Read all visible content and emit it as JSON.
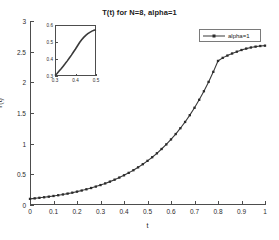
{
  "figure": {
    "background": "#ffffff",
    "line_color": "#3a3a3a",
    "marker_color": "#2b2b2b",
    "axis_color": "#4d4d4d"
  },
  "chart_data": {
    "type": "line",
    "title": "T(t) for N=8, alpha=1",
    "xlabel": "t",
    "ylabel": "T(t)",
    "xlim": [
      0,
      1
    ],
    "ylim": [
      0,
      3
    ],
    "grid": false,
    "legend_position": "upper right",
    "xticks": [
      "0",
      "0.1",
      "0.2",
      "0.3",
      "0.4",
      "0.5",
      "0.6",
      "0.7",
      "0.8",
      "0.9",
      "1"
    ],
    "xtick_values": [
      0,
      0.1,
      0.2,
      0.3,
      0.4,
      0.5,
      0.6,
      0.7,
      0.8,
      0.9,
      1
    ],
    "yticks": [
      "0",
      "0.5",
      "1",
      "1.5",
      "2",
      "2.5",
      "3"
    ],
    "ytick_values": [
      0,
      0.5,
      1,
      1.5,
      2,
      2.5,
      3
    ],
    "series": [
      {
        "name": "alpha=1",
        "marker": "square",
        "linestyle": "solid",
        "x": [
          0,
          0.02,
          0.04,
          0.06,
          0.08,
          0.1,
          0.12,
          0.14,
          0.16,
          0.18,
          0.2,
          0.22,
          0.24,
          0.26,
          0.28,
          0.3,
          0.32,
          0.34,
          0.36,
          0.38,
          0.4,
          0.42,
          0.44,
          0.46,
          0.48,
          0.5,
          0.52,
          0.54,
          0.56,
          0.58,
          0.6,
          0.62,
          0.64,
          0.66,
          0.68,
          0.7,
          0.72,
          0.74,
          0.76,
          0.78,
          0.8,
          0.82,
          0.84,
          0.86,
          0.88,
          0.9,
          0.92,
          0.94,
          0.96,
          0.98,
          1.0
        ],
        "y": [
          0.1,
          0.108,
          0.117,
          0.126,
          0.136,
          0.147,
          0.159,
          0.172,
          0.186,
          0.201,
          0.218,
          0.236,
          0.256,
          0.277,
          0.3,
          0.325,
          0.352,
          0.381,
          0.413,
          0.447,
          0.484,
          0.524,
          0.567,
          0.614,
          0.665,
          0.72,
          0.779,
          0.843,
          0.913,
          0.988,
          1.069,
          1.157,
          1.252,
          1.354,
          1.465,
          1.585,
          1.715,
          1.855,
          2.007,
          2.171,
          2.349,
          2.399,
          2.436,
          2.47,
          2.5,
          2.527,
          2.55,
          2.568,
          2.582,
          2.592,
          2.598
        ]
      }
    ],
    "inset": {
      "xlim": [
        0.3,
        0.5
      ],
      "ylim": [
        0.3,
        0.6
      ],
      "xticks": [
        "0.3",
        "0.4",
        "0.5"
      ],
      "xtick_values": [
        0.3,
        0.4,
        0.5
      ],
      "yticks": [
        "0.3",
        "0.4",
        "0.5",
        "0.6"
      ],
      "ytick_values": [
        0.3,
        0.4,
        0.5,
        0.6
      ],
      "series": [
        {
          "name": "alpha=1",
          "x": [
            0.3,
            0.31,
            0.32,
            0.33,
            0.34,
            0.35,
            0.36,
            0.37,
            0.38,
            0.39,
            0.4,
            0.41,
            0.42,
            0.43,
            0.44,
            0.45,
            0.46,
            0.47,
            0.48,
            0.49,
            0.5
          ],
          "y": [
            0.302,
            0.315,
            0.329,
            0.343,
            0.358,
            0.373,
            0.389,
            0.406,
            0.423,
            0.441,
            0.459,
            0.478,
            0.497,
            0.513,
            0.527,
            0.539,
            0.549,
            0.557,
            0.564,
            0.569,
            0.572
          ]
        }
      ]
    },
    "legend": {
      "entries": [
        {
          "label": "alpha=1"
        }
      ]
    }
  }
}
